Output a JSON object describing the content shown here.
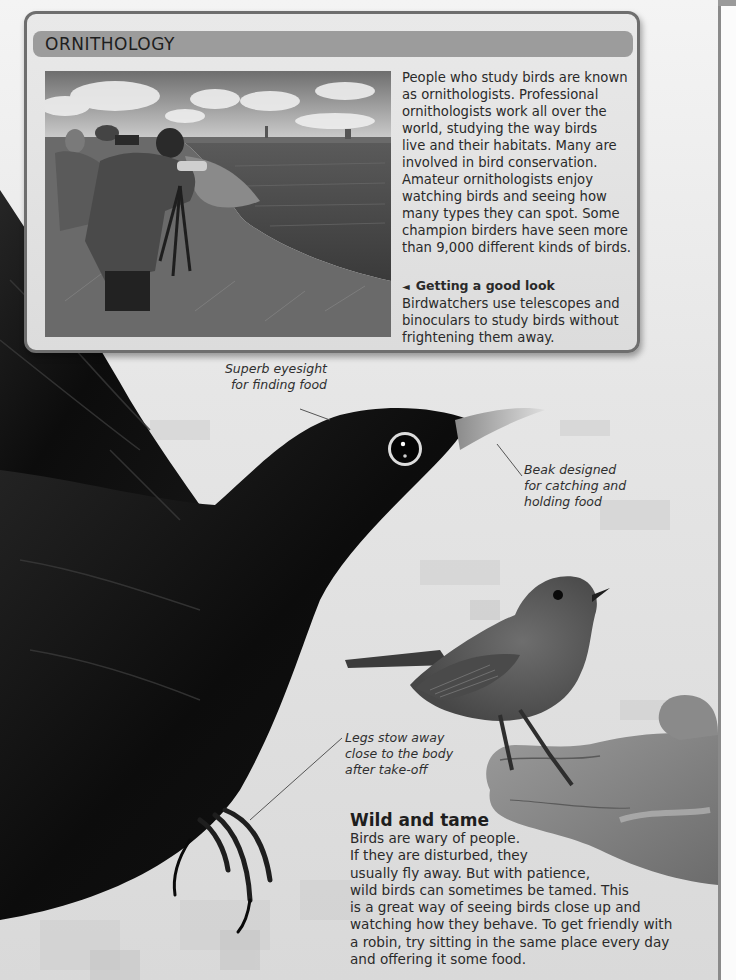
{
  "panel": {
    "title": "ORNITHOLOGY",
    "body_lines": [
      "People who study birds are known",
      "as ornithologists. Professional",
      "ornithologists work all over the",
      "world, studying the way birds",
      "live and their habitats. Many are",
      "involved in bird conservation.",
      "Amateur ornithologists enjoy",
      "watching birds and seeing how",
      "many types they can spot. Some",
      "champion birders have seen more",
      "than 9,000 different kinds of birds."
    ],
    "caption": {
      "arrow_icon": "◄",
      "heading": "Getting a good look",
      "lines": [
        "Birdwatchers use telescopes and",
        "binoculars to study birds without",
        "frightening them away."
      ]
    },
    "photo_alt": "Birdwatchers with telescopes and binoculars on a grassy bank by the water"
  },
  "annotations": {
    "eyesight": [
      "Superb eyesight",
      "for finding food"
    ],
    "beak": [
      "Beak designed",
      "for catching and",
      "holding food"
    ],
    "legs": [
      "Legs stow away",
      "close to the body",
      "after take-off"
    ]
  },
  "wild_and_tame": {
    "title": "Wild and tame",
    "lines": [
      "Birds are wary of people.",
      "If they are disturbed, they",
      "usually fly away. But with patience,",
      "wild birds can sometimes be tamed. This",
      "is a great way of seeing birds close up and",
      "watching how they behave. To get friendly with",
      "a robin, try sitting in the same place every day",
      "and offering it some food."
    ]
  },
  "colors": {
    "panel_bg": "#e3e3e3",
    "panel_border": "#6e6e6e",
    "header_bar": "#9c9c9c",
    "blackbird": "#0e0e0e",
    "robin": "#5c5c5c",
    "page_bg": "#ededed"
  }
}
